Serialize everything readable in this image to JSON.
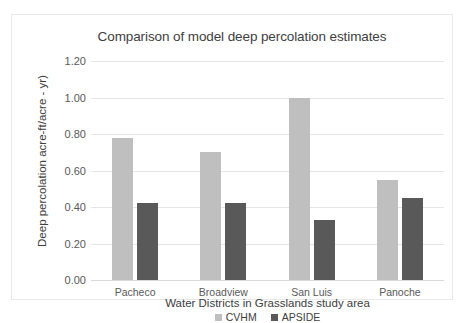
{
  "chart_data": {
    "type": "bar",
    "title": "Comparison of model deep percolation estimates",
    "xlabel": "Water Districts in Grasslands study area",
    "ylabel": "Deep percolation  acre-ft/acre - yr)",
    "categories": [
      "Pacheco",
      "Broadview",
      "San Luis",
      "Panoche"
    ],
    "series": [
      {
        "name": "CVHM",
        "color": "#bfbfbf",
        "values": [
          0.78,
          0.7,
          1.0,
          0.55
        ]
      },
      {
        "name": "APSIDE",
        "color": "#595959",
        "values": [
          0.42,
          0.42,
          0.33,
          0.45
        ]
      }
    ],
    "ylim": [
      0.0,
      1.2
    ],
    "ytick_values": [
      1.2,
      1.0,
      0.8,
      0.6,
      0.4,
      0.2,
      0.0
    ],
    "ytick_labels": [
      "1.20",
      "1.00",
      "0.80",
      "0.60",
      "0.40",
      "0.20",
      "0.00"
    ],
    "grid": true,
    "legend_position": "bottom"
  }
}
